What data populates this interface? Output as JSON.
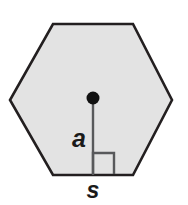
{
  "figure": {
    "name": "regular-hexagon-with-apothem",
    "caption": "",
    "background_color": "#ffffff",
    "shape": {
      "type": "hexagon",
      "sides": 6,
      "fill_color": "#e3e3e3",
      "stroke_color": "#231f20",
      "stroke_width": 2.6,
      "vertices": [
        [
          53,
          24
        ],
        [
          133,
          24
        ],
        [
          172,
          100
        ],
        [
          133,
          175
        ],
        [
          53,
          175
        ],
        [
          10,
          100
        ]
      ]
    },
    "center_point": {
      "name": "center-dot",
      "x": 93,
      "y": 98,
      "radius": 6.5,
      "color": "#111111"
    },
    "apothem_segment": {
      "name": "apothem-line",
      "x1": 93,
      "y1": 98,
      "x2": 93,
      "y2": 175,
      "color": "#58595b",
      "width": 2.4
    },
    "right_angle_marker": {
      "name": "right-angle-marker",
      "x": 93,
      "y": 153,
      "size": 21,
      "color": "#58595b",
      "width": 2.4
    },
    "labels": {
      "apothem": {
        "text": "a",
        "x": 79,
        "y": 147,
        "font_size": 25,
        "color": "#1a1a1a"
      },
      "side": {
        "text": "s",
        "x": 93,
        "y": 198,
        "font_size": 23,
        "color": "#1a1a1a"
      }
    }
  }
}
